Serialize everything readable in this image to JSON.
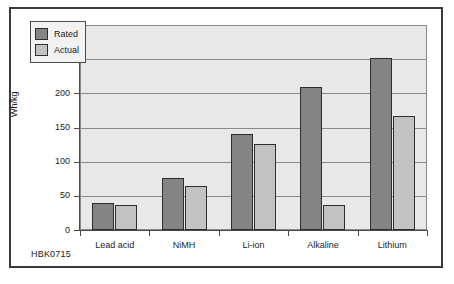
{
  "figure": {
    "caption": "HBK0715"
  },
  "legend": {
    "position": "inside-top-left",
    "entries": [
      {
        "label": "Rated",
        "color": "#848484",
        "icon": "legend-swatch-icon"
      },
      {
        "label": "Actual",
        "color": "#c2c2c2",
        "icon": "legend-swatch-icon"
      }
    ]
  },
  "chart_data": {
    "type": "bar",
    "title": "",
    "subtitle": "",
    "xlabel": "",
    "ylabel": "Wh/kg",
    "categories": [
      "Lead acid",
      "NiMH",
      "Li-ion",
      "Alkaline",
      "Lithium"
    ],
    "series": [
      {
        "name": "Rated",
        "color": "#848484",
        "values": [
          40,
          76,
          140,
          209,
          252
        ]
      },
      {
        "name": "Actual",
        "color": "#c2c2c2",
        "values": [
          37,
          65,
          126,
          37,
          167
        ]
      }
    ],
    "ylim": [
      0,
      300
    ],
    "yticks": [
      0,
      50,
      100,
      150,
      200,
      250,
      300
    ],
    "ytick_labels": [
      "0",
      "50",
      "100",
      "150",
      "200",
      "250",
      "300"
    ],
    "grid": "horizontal",
    "legend_position": "upper left",
    "plot_background": "#e8e8e8",
    "axis_color": "#4a4a4a",
    "gridline_color": "#8a8a8a"
  }
}
